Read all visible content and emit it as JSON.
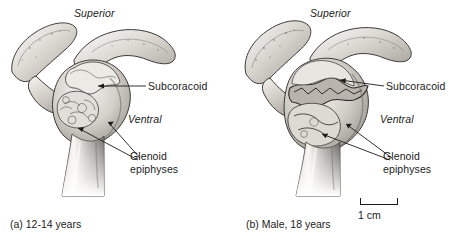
{
  "figure": {
    "background_color": "#ffffff",
    "ink_color": "#1b1b1b",
    "panels": [
      {
        "id": "a",
        "caption": "(a) 12-14 years",
        "artwork_name": "scapula-glenoid-epiphyses-juvenile",
        "labels": {
          "superior": "Superior",
          "ventral": "Ventral",
          "subcoracoid": "Subcoracoid",
          "glenoid_epiphyses": "Glenoid epiphyses"
        }
      },
      {
        "id": "b",
        "caption": "(b) Male, 18 years",
        "artwork_name": "scapula-glenoid-epiphyses-adult",
        "labels": {
          "superior": "Superior",
          "ventral": "Ventral",
          "subcoracoid": "Subcoracoid",
          "glenoid_epiphyses": "Glenoid epiphyses"
        }
      }
    ],
    "scale_bar": {
      "label": "1 cm",
      "length_px": 38
    }
  }
}
